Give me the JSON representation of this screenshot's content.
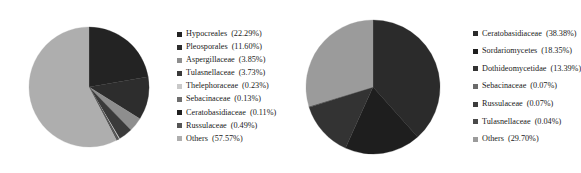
{
  "chart_data": [
    {
      "type": "pie",
      "title": "",
      "panel": "left",
      "legend_position": "right",
      "categories": [
        "Hypocreales",
        "Pleosporales",
        "Aspergillaceae",
        "Tulasnellaceae",
        "Thelephoraceae",
        "Sebacinaceae",
        "Ceratobasidiaceae",
        "Russulaceae",
        "Others"
      ],
      "values": [
        22.29,
        11.6,
        3.85,
        3.73,
        0.23,
        0.13,
        0.11,
        0.49,
        57.57
      ],
      "unit": "%",
      "colors": [
        "#232323",
        "#2d2d2d",
        "#8e8e8e",
        "#3a3a3a",
        "#c9c9c9",
        "#6e6e6e",
        "#1f1f1f",
        "#555555",
        "#aeaeae"
      ],
      "legend_entries": [
        {
          "label": "Hypocreales",
          "pct": "(22.29%)",
          "color": "#232323"
        },
        {
          "label": "Pleosporales",
          "pct": "(11.60%)",
          "color": "#2d2d2d"
        },
        {
          "label": "Aspergillaceae",
          "pct": "(3.85%)",
          "color": "#8e8e8e"
        },
        {
          "label": "Tulasnellaceae",
          "pct": "(3.73%)",
          "color": "#3a3a3a"
        },
        {
          "label": "Thelephoraceae",
          "pct": "(0.23%)",
          "color": "#c9c9c9"
        },
        {
          "label": "Sebacinaceae",
          "pct": "(0.13%)",
          "color": "#6e6e6e"
        },
        {
          "label": "Ceratobasidiaceae",
          "pct": "(0.11%)",
          "color": "#1f1f1f"
        },
        {
          "label": "Russulaceae",
          "pct": "(0.49%)",
          "color": "#555555"
        },
        {
          "label": "Others",
          "pct": "(57.57%)",
          "color": "#aeaeae"
        }
      ]
    },
    {
      "type": "pie",
      "title": "",
      "panel": "right",
      "legend_position": "right",
      "categories": [
        "Ceratobasidiaceae",
        "Sordariomycetes",
        "Dothideomycetidae",
        "Sebacinaceae",
        "Russulaceae",
        "Tulasnellaceae",
        "Others"
      ],
      "values": [
        38.38,
        18.35,
        13.39,
        0.07,
        0.07,
        0.04,
        29.7
      ],
      "unit": "%",
      "colors": [
        "#2b2b2b",
        "#1e1e1e",
        "#333333",
        "#6a6a6a",
        "#3c3c3c",
        "#4a4a4a",
        "#9b9b9b"
      ],
      "legend_entries": [
        {
          "label": "Ceratobasidiaceae",
          "pct": "(38.38%)",
          "color": "#2b2b2b"
        },
        {
          "label": "Sordariomycetes",
          "pct": "(18.35%)",
          "color": "#1e1e1e"
        },
        {
          "label": "Dothideomycetidae",
          "pct": "(13.39%)",
          "color": "#333333"
        },
        {
          "label": "Sebacinaceae",
          "pct": "(0.07%)",
          "color": "#6a6a6a"
        },
        {
          "label": "Russulaceae",
          "pct": "(0.07%)",
          "color": "#3c3c3c"
        },
        {
          "label": "Tulasnellaceae",
          "pct": "(0.04%)",
          "color": "#4a4a4a"
        },
        {
          "label": "Others",
          "pct": "(29.70%)",
          "color": "#9b9b9b"
        }
      ]
    }
  ]
}
